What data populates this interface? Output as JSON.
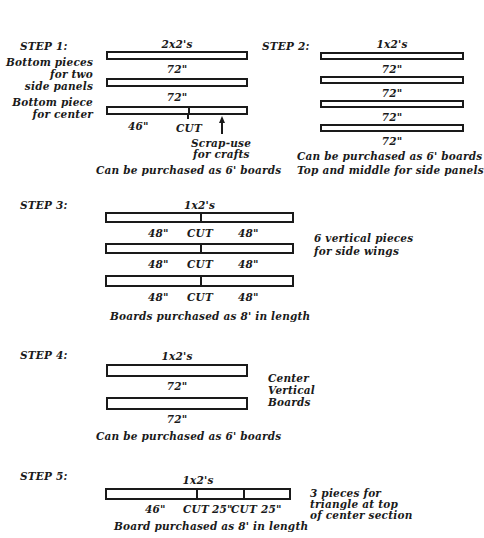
{
  "step1": {
    "title": "STEP 1:",
    "lumber": "2x2's",
    "label_side": [
      "Bottom pieces",
      "for two",
      "side panels"
    ],
    "label_center": [
      "Bottom piece",
      "for center"
    ],
    "boards": [
      {
        "length": "72\""
      },
      {
        "length": "72\""
      },
      {
        "piece": "46\"",
        "cut": "CUT"
      }
    ],
    "scrap_note": [
      "Scrap-use",
      "for crafts"
    ],
    "note": "Can be purchased as 6' boards"
  },
  "step2": {
    "title": "STEP 2:",
    "lumber": "1x2's",
    "boards": [
      {
        "length": "72\""
      },
      {
        "length": "72\""
      },
      {
        "length": "72\""
      },
      {
        "length": "72\""
      }
    ],
    "notes": [
      "Can be purchased as 6' boards",
      "Top and middle for side panels"
    ]
  },
  "step3": {
    "title": "STEP 3:",
    "lumber": "1x2's",
    "boards": [
      {
        "left": "48\"",
        "cut": "CUT",
        "right": "48\""
      },
      {
        "left": "48\"",
        "cut": "CUT",
        "right": "48\""
      },
      {
        "left": "48\"",
        "cut": "CUT",
        "right": "48\""
      }
    ],
    "side_label": [
      "6 vertical pieces",
      "for side wings"
    ],
    "note": "Boards purchased as 8' in length"
  },
  "step4": {
    "title": "STEP 4:",
    "lumber": "1x2's",
    "boards": [
      {
        "length": "72\""
      },
      {
        "length": "72\""
      }
    ],
    "side_label": [
      "Center",
      "Vertical",
      "Boards"
    ],
    "note": "Can be purchased as 6' boards"
  },
  "step5": {
    "title": "STEP 5:",
    "lumber": "1x2's",
    "board": {
      "piece1": "46\"",
      "cut1": "CUT",
      "piece2": "25\"",
      "cut2": "CUT",
      "piece3": "25\""
    },
    "side_label": [
      "3 pieces for",
      "triangle at top",
      "of center section"
    ],
    "note": "Board purchased as 8' in length"
  }
}
